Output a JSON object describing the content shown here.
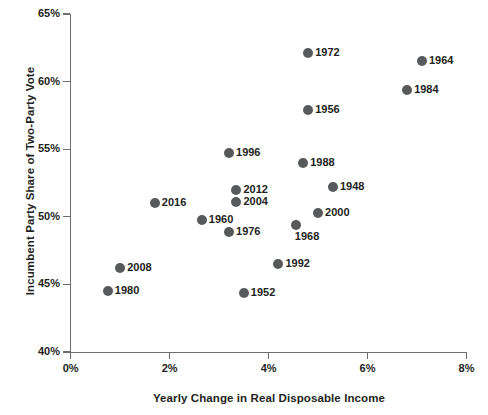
{
  "chart_data": {
    "type": "scatter",
    "title": "",
    "xlabel": "Yearly Change in Real Disposable Income",
    "ylabel": "Incumbent Party Share of Two-Party Vote",
    "xlim": [
      0,
      8
    ],
    "ylim": [
      40,
      65
    ],
    "grid": false,
    "legend": "none",
    "point_color": "#58595b",
    "axis_color": "#6d6e71",
    "x_unit": "%",
    "y_unit": "%",
    "xticks": [
      "0%",
      "2%",
      "4%",
      "6%",
      "8%"
    ],
    "xtick_values": [
      0,
      2,
      4,
      6,
      8
    ],
    "yticks": [
      "40%",
      "45%",
      "50%",
      "55%",
      "60%",
      "65%"
    ],
    "ytick_values": [
      40,
      45,
      50,
      55,
      60,
      65
    ],
    "points": [
      {
        "label": "1972",
        "x": 4.8,
        "y": 62.1,
        "label_pos": "right"
      },
      {
        "label": "1964",
        "x": 7.1,
        "y": 61.5,
        "label_pos": "right"
      },
      {
        "label": "1984",
        "x": 6.8,
        "y": 59.4,
        "label_pos": "right"
      },
      {
        "label": "1956",
        "x": 4.8,
        "y": 57.9,
        "label_pos": "right"
      },
      {
        "label": "1996",
        "x": 3.2,
        "y": 54.7,
        "label_pos": "right"
      },
      {
        "label": "1988",
        "x": 4.7,
        "y": 54.0,
        "label_pos": "right"
      },
      {
        "label": "1948",
        "x": 5.3,
        "y": 52.2,
        "label_pos": "right"
      },
      {
        "label": "2012",
        "x": 3.35,
        "y": 52.0,
        "label_pos": "right"
      },
      {
        "label": "2004",
        "x": 3.35,
        "y": 51.1,
        "label_pos": "right"
      },
      {
        "label": "2016",
        "x": 1.7,
        "y": 51.0,
        "label_pos": "right"
      },
      {
        "label": "2000",
        "x": 5.0,
        "y": 50.3,
        "label_pos": "right"
      },
      {
        "label": "1960",
        "x": 2.65,
        "y": 49.8,
        "label_pos": "right"
      },
      {
        "label": "1968",
        "x": 4.55,
        "y": 49.4,
        "label_pos": "below-right"
      },
      {
        "label": "1976",
        "x": 3.2,
        "y": 48.9,
        "label_pos": "right"
      },
      {
        "label": "1992",
        "x": 4.2,
        "y": 46.5,
        "label_pos": "right"
      },
      {
        "label": "2008",
        "x": 1.0,
        "y": 46.2,
        "label_pos": "right"
      },
      {
        "label": "1952",
        "x": 3.5,
        "y": 44.4,
        "label_pos": "right"
      },
      {
        "label": "1980",
        "x": 0.75,
        "y": 44.5,
        "label_pos": "right"
      }
    ]
  }
}
